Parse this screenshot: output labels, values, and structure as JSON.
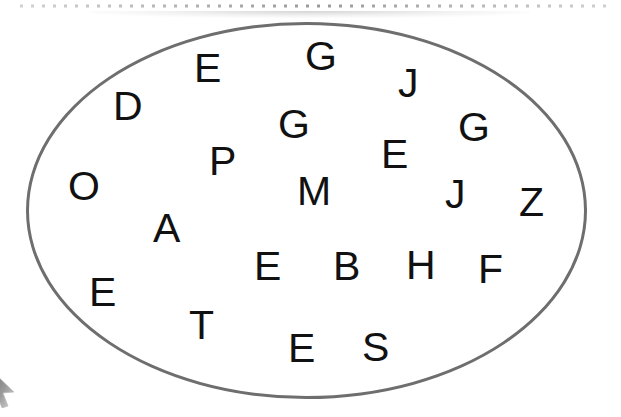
{
  "canvas": {
    "width": 621,
    "height": 417,
    "background_color": "#ffffff"
  },
  "top_rule": {
    "name": "dotted-rule",
    "style": "dotted",
    "dot_color": "#9a9a9a",
    "dot_size": 3,
    "dot_spacing": 11,
    "start_x": 20,
    "end_x": 612,
    "y": 6
  },
  "ellipse": {
    "name": "ellipse-outline",
    "stroke_color": "#6e6e6e",
    "stroke_width": 3,
    "fill": "none",
    "left": 26,
    "top": 22,
    "width": 561,
    "height": 377
  },
  "cursor": {
    "name": "mouse-cursor",
    "kind": "arrow-pointer",
    "color": "#8a8a8a",
    "x": -10,
    "y": 368
  },
  "letters": [
    {
      "char": "D",
      "x": 113,
      "y": 86,
      "size": 41
    },
    {
      "char": "E",
      "x": 194,
      "y": 48,
      "size": 41
    },
    {
      "char": "G",
      "x": 305,
      "y": 36,
      "size": 41
    },
    {
      "char": "J",
      "x": 398,
      "y": 63,
      "size": 41
    },
    {
      "char": "G",
      "x": 278,
      "y": 104,
      "size": 41
    },
    {
      "char": "G",
      "x": 458,
      "y": 107,
      "size": 41
    },
    {
      "char": "P",
      "x": 209,
      "y": 141,
      "size": 41
    },
    {
      "char": "E",
      "x": 381,
      "y": 134,
      "size": 41
    },
    {
      "char": "O",
      "x": 68,
      "y": 166,
      "size": 41
    },
    {
      "char": "M",
      "x": 297,
      "y": 171,
      "size": 41
    },
    {
      "char": "J",
      "x": 445,
      "y": 174,
      "size": 41
    },
    {
      "char": "Z",
      "x": 519,
      "y": 182,
      "size": 41
    },
    {
      "char": "A",
      "x": 153,
      "y": 208,
      "size": 41
    },
    {
      "char": "E",
      "x": 254,
      "y": 246,
      "size": 41
    },
    {
      "char": "B",
      "x": 333,
      "y": 246,
      "size": 41
    },
    {
      "char": "H",
      "x": 406,
      "y": 245,
      "size": 41
    },
    {
      "char": "F",
      "x": 478,
      "y": 249,
      "size": 41
    },
    {
      "char": "E",
      "x": 89,
      "y": 272,
      "size": 41
    },
    {
      "char": "T",
      "x": 189,
      "y": 305,
      "size": 41
    },
    {
      "char": "E",
      "x": 288,
      "y": 328,
      "size": 41
    },
    {
      "char": "S",
      "x": 362,
      "y": 327,
      "size": 41
    }
  ]
}
